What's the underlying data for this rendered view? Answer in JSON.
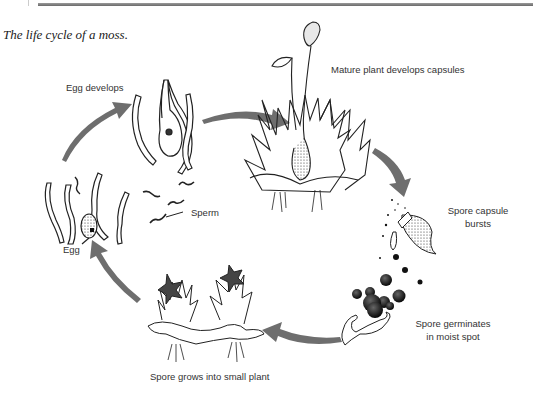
{
  "caption": "The life cycle of a moss.",
  "stages": [
    {
      "id": "egg-develops",
      "label": "Egg develops"
    },
    {
      "id": "mature-plant",
      "label": "Mature plant develops capsules"
    },
    {
      "id": "capsule-bursts",
      "label_line1": "Spore capsule",
      "label_line2": "bursts"
    },
    {
      "id": "spore-germinates",
      "label_line1": "Spore germinates",
      "label_line2": "in moist spot"
    },
    {
      "id": "small-plant",
      "label": "Spore grows into small plant"
    },
    {
      "id": "egg",
      "label": "Egg"
    },
    {
      "id": "sperm",
      "label": "Sperm"
    }
  ],
  "colors": {
    "arrow": "#6e6e6e",
    "line": "#222222",
    "text": "#333333"
  }
}
